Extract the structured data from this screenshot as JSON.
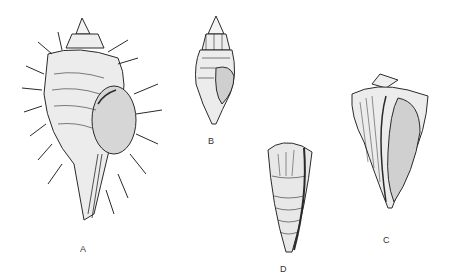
{
  "figure": {
    "labels": {
      "a": "A",
      "b": "B",
      "c": "C",
      "d": "D"
    },
    "colors": {
      "ink": "#2a2a2a",
      "background": "#ffffff"
    }
  }
}
